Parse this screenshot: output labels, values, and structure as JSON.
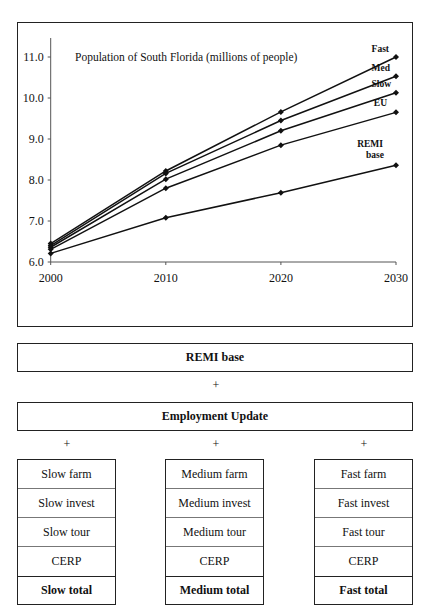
{
  "chart_data": {
    "type": "line",
    "title": "Population of South Florida (millions of people)",
    "xlabel": "",
    "ylabel": "",
    "x": [
      2000,
      2010,
      2020,
      2030
    ],
    "x_tick_labels": [
      "2000",
      "2010",
      "2020",
      "2030"
    ],
    "y_tick_labels": [
      "6.0",
      "7.0",
      "8.0",
      "9.0",
      "10.0",
      "11.0"
    ],
    "ylim": [
      6.0,
      11.5
    ],
    "grid": false,
    "legend_position": "inline-right",
    "series": [
      {
        "name": "Fast",
        "values": [
          6.45,
          8.22,
          9.66,
          11.0
        ]
      },
      {
        "name": "Med",
        "values": [
          6.4,
          8.16,
          9.45,
          10.53
        ]
      },
      {
        "name": "Slow",
        "values": [
          6.36,
          8.02,
          9.2,
          10.13
        ]
      },
      {
        "name": "EU",
        "values": [
          6.31,
          7.8,
          8.85,
          9.65
        ]
      },
      {
        "name": "REMI base",
        "values": [
          6.21,
          7.08,
          7.69,
          8.36
        ]
      }
    ]
  },
  "diagram": {
    "remi_base": "REMI base",
    "plus": "+",
    "employment_update": "Employment Update",
    "columns": [
      {
        "cells": [
          "Slow farm",
          "Slow invest",
          "Slow tour",
          "CERP"
        ],
        "total": "Slow total"
      },
      {
        "cells": [
          "Medium farm",
          "Medium invest",
          "Medium tour",
          "CERP"
        ],
        "total": "Medium total"
      },
      {
        "cells": [
          "Fast farm",
          "Fast invest",
          "Fast tour",
          "CERP"
        ],
        "total": "Fast total"
      }
    ]
  }
}
